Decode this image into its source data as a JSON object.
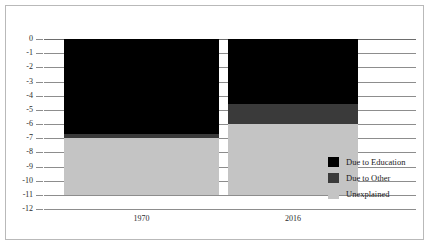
{
  "chart_data": {
    "type": "bar",
    "stacked": true,
    "orientation": "vertical-negative",
    "title": "",
    "subtitle": "",
    "xlabel": "",
    "ylabel": "",
    "categories": [
      "1970",
      "2016"
    ],
    "ylim": [
      -12,
      0
    ],
    "ytick_labels": [
      "0",
      "-1",
      "-2",
      "-3",
      "-4",
      "-5",
      "-6",
      "-7",
      "-8",
      "-9",
      "-10",
      "-11",
      "-12"
    ],
    "ytick_values": [
      0,
      -1,
      -2,
      -3,
      -4,
      -5,
      -6,
      -7,
      -8,
      -9,
      -10,
      -11,
      -12
    ],
    "grid": true,
    "legend_position": "right",
    "series": [
      {
        "name": "Due to Education",
        "color": "#000000",
        "values": [
          -6.7,
          -4.6
        ]
      },
      {
        "name": "Due to Other",
        "color": "#3a3a3a",
        "values": [
          -0.3,
          -1.4
        ]
      },
      {
        "name": "Unexplained",
        "color": "#c4c4c4",
        "values": [
          -4.0,
          -5.0
        ]
      }
    ],
    "totals": [
      -11.0,
      -11.0
    ],
    "segment_boundaries": {
      "1970": [
        0,
        -6.7,
        -7.0,
        -11.0
      ],
      "2016": [
        0,
        -4.6,
        -6.0,
        -11.0
      ]
    }
  },
  "legend": {
    "items": [
      {
        "label": "Due to Education",
        "color": "#000000"
      },
      {
        "label": "Due to Other",
        "color": "#3a3a3a"
      },
      {
        "label": "Unexplained",
        "color": "#c4c4c4"
      }
    ]
  },
  "colors": {
    "education": "#000000",
    "other": "#3a3a3a",
    "unexplained": "#c4c4c4",
    "gridline": "#8d8d8d",
    "frame": "#b9b9b9",
    "text": "#2b2b2b",
    "background": "#ffffff"
  }
}
